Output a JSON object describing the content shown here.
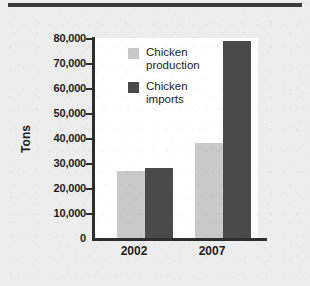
{
  "chart_data": {
    "type": "bar",
    "title": "",
    "xlabel": "",
    "ylabel": "Tons",
    "categories": [
      "2002",
      "2007"
    ],
    "series": [
      {
        "name": "Chicken\nproduction",
        "key": "production",
        "color": "#c9c9c9",
        "values": [
          27000,
          38000
        ]
      },
      {
        "name": "Chicken\nimports",
        "key": "imports",
        "color": "#4a4a4a",
        "values": [
          28000,
          79000
        ]
      }
    ],
    "ylim": [
      0,
      80000
    ],
    "ytick_step": 10000,
    "ytick_labels": [
      "80,000",
      "70,000",
      "60,000",
      "50,000",
      "40,000",
      "30,000",
      "20,000",
      "10,000",
      "0"
    ],
    "ytick_values": [
      80000,
      70000,
      60000,
      50000,
      40000,
      30000,
      20000,
      10000,
      0
    ],
    "grid": false,
    "legend_position": "top-center-inside"
  },
  "colors": {
    "page_background": "#ededed",
    "plot_background": "#ffffff",
    "axis": "#2e2e2e",
    "rule": "#3a3a3a",
    "text": "#1d1d1d",
    "light_bar": "#c9c9c9",
    "dark_bar": "#4a4a4a"
  }
}
